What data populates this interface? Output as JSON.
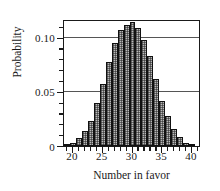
{
  "chart_data": {
    "type": "bar",
    "title": "",
    "subtitle": "",
    "xlabel": "Number in favor",
    "ylabel": "Probability",
    "xlim": [
      18.5,
      41.5
    ],
    "ylim": [
      0,
      0.1173
    ],
    "grid": true,
    "legend": null,
    "x_ticks_major": [
      20,
      25,
      30,
      35,
      40
    ],
    "x_tick_labels": [
      "20",
      "25",
      "30",
      "35",
      "40"
    ],
    "x_ticks_minor": [
      19,
      21,
      22,
      23,
      24,
      26,
      27,
      28,
      29,
      31,
      32,
      33,
      34,
      36,
      37,
      38,
      39,
      41
    ],
    "y_ticks_major": [
      0,
      0.05,
      0.1
    ],
    "y_tick_labels": [
      "0",
      "0.05",
      "0.10"
    ],
    "y_ticks_minor": [
      0.01,
      0.02,
      0.03,
      0.04,
      0.06,
      0.07,
      0.08,
      0.09,
      0.11
    ],
    "gridlines_y": [
      0.05,
      0.1
    ],
    "categories": [
      19,
      20,
      21,
      22,
      23,
      24,
      25,
      26,
      27,
      28,
      29,
      30,
      31,
      32,
      33,
      34,
      35,
      36,
      37,
      38,
      39,
      40
    ],
    "values": [
      0.001,
      0.003,
      0.007,
      0.014,
      0.023,
      0.04,
      0.057,
      0.078,
      0.095,
      0.107,
      0.112,
      0.115,
      0.109,
      0.098,
      0.083,
      0.062,
      0.042,
      0.028,
      0.016,
      0.008,
      0.003,
      0.002
    ],
    "bar_fill_color": "#b9b9b9",
    "bar_edge_color": "#111111",
    "bar_fill_pattern": "checkered-dither"
  },
  "axis_titles": {
    "y": "Probability",
    "x": "Number in favor"
  }
}
